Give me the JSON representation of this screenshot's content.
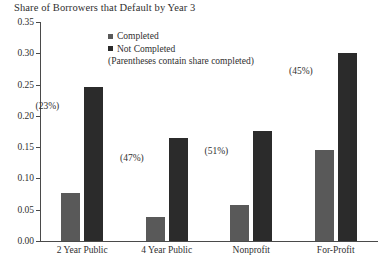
{
  "chart_data": {
    "type": "bar",
    "title": "Share of Borrowers that Default by Year 3",
    "xlabel": "",
    "ylabel": "",
    "ylim": [
      0,
      0.35
    ],
    "ytick_labels": [
      "0.00",
      "0.05",
      "0.10",
      "0.15",
      "0.20",
      "0.25",
      "0.30",
      "0.35"
    ],
    "ytick_values": [
      0,
      0.05,
      0.1,
      0.15,
      0.2,
      0.25,
      0.3,
      0.35
    ],
    "grid": false,
    "legend_position": "upper-center",
    "categories": [
      "2 Year Public",
      "4 Year Public",
      "Nonprofit",
      "For-Profit"
    ],
    "series": [
      {
        "name": "Completed",
        "color": "#595959",
        "values": [
          0.076,
          0.038,
          0.057,
          0.146
        ]
      },
      {
        "name": "Not Completed",
        "color": "#2b2b2b",
        "values": [
          0.246,
          0.165,
          0.176,
          0.301
        ]
      }
    ],
    "annotations": [
      {
        "text": "(23%)",
        "category": "2 Year Public",
        "value": 0.215
      },
      {
        "text": "(47%)",
        "category": "4 Year Public",
        "value": 0.133
      },
      {
        "text": "(51%)",
        "category": "Nonprofit",
        "value": 0.144
      },
      {
        "text": "(45%)",
        "category": "For-Profit",
        "value": 0.272
      }
    ],
    "legend_note": "(Parentheses contain share completed)"
  }
}
